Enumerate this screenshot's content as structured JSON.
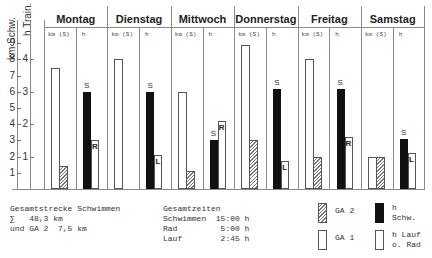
{
  "chart_data": {
    "type": "bar",
    "title": "",
    "ylabel_left": "km Schw.",
    "ylabel_right": "h Train.",
    "y_ticks_km": [
      1,
      2,
      3,
      4,
      5,
      6,
      7,
      8,
      9
    ],
    "y_ticks_h": [
      1,
      2,
      3,
      4
    ],
    "ylim_km": [
      0,
      9
    ],
    "ylim_h": [
      0,
      4.5
    ],
    "grid": false,
    "column_headers": {
      "km": "km (S)",
      "h": "h"
    },
    "categories": [
      "Montag",
      "Dienstag",
      "Mittwoch",
      "Donnerstag",
      "Freitag",
      "Samstag"
    ],
    "series": [
      {
        "name": "GA 1",
        "unit": "km",
        "style": "white",
        "values": [
          7.5,
          8.0,
          6.0,
          8.9,
          8.0,
          2.0
        ]
      },
      {
        "name": "GA 2",
        "unit": "km",
        "style": "hatched",
        "values": [
          1.4,
          0,
          1.1,
          3.0,
          2.0,
          2.0
        ]
      },
      {
        "name": "h Schw.",
        "unit": "h",
        "style": "black",
        "label": "S",
        "values": [
          3.0,
          3.0,
          1.5,
          3.1,
          3.1,
          1.55
        ]
      },
      {
        "name": "h Lauf o. Rad",
        "unit": "h",
        "style": "white",
        "labels": [
          "R",
          "L",
          "R",
          "L",
          "R",
          "L"
        ],
        "values": [
          1.5,
          1.05,
          2.1,
          0.85,
          1.6,
          1.1
        ]
      }
    ],
    "legend": [
      {
        "key": "ga2",
        "label": "GA 2"
      },
      {
        "key": "swim",
        "label": "h\nSchw."
      },
      {
        "key": "ga1",
        "label": "GA 1"
      },
      {
        "key": "other",
        "label": "h Lauf\no. Rad"
      }
    ],
    "legend_position": "bottom-right",
    "annotations": {
      "distance": "Gesamtstrecke Schwimmen\n∑   48,3 km\nund GA 2  7,5 km",
      "times": "Gesamtzeiten\nSchwimmen  15:00 h\nRad         5:00 h\nLauf        2:45 h"
    }
  }
}
